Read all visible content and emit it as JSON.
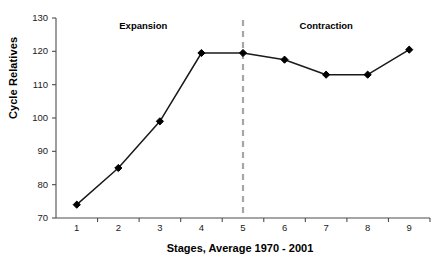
{
  "chart_data": {
    "type": "line",
    "title": "",
    "xlabel": "Stages, Average 1970 - 2001",
    "ylabel": "Cycle Relatives",
    "x": [
      1,
      2,
      3,
      4,
      5,
      6,
      7,
      8,
      9
    ],
    "categories": [
      "1",
      "2",
      "3",
      "4",
      "5",
      "6",
      "7",
      "8",
      "9"
    ],
    "values": [
      74,
      85,
      99,
      119.5,
      119.5,
      117.5,
      113,
      113,
      120.5
    ],
    "series": [
      {
        "name": "Cycle Relatives",
        "values": [
          74,
          85,
          99,
          119.5,
          119.5,
          117.5,
          113,
          113,
          120.5
        ]
      }
    ],
    "xlim": [
      0.5,
      9.5
    ],
    "ylim": [
      70,
      130
    ],
    "ytick_labels": [
      "70",
      "80",
      "90",
      "100",
      "110",
      "120",
      "130"
    ],
    "yticks": [
      70,
      80,
      90,
      100,
      110,
      120,
      130
    ],
    "xtick_labels": [
      "1",
      "2",
      "3",
      "4",
      "5",
      "6",
      "7",
      "8",
      "9"
    ],
    "grid": false,
    "legend": "none",
    "marker": "diamond",
    "line_color": "#1a1a1a",
    "marker_color": "#000000",
    "axis_color": "#4d4d4d",
    "annotations": [
      {
        "text": "Expansion",
        "x": 2.6,
        "y": 127.5
      },
      {
        "text": "Contraction",
        "x": 7.0,
        "y": 127.5
      }
    ],
    "reference_lines": [
      {
        "orientation": "vertical",
        "x": 5,
        "style": "dashed",
        "color": "#a6a6a6"
      }
    ]
  },
  "figure": {
    "background": "#ffffff",
    "border_color": "#9a9a9a"
  }
}
